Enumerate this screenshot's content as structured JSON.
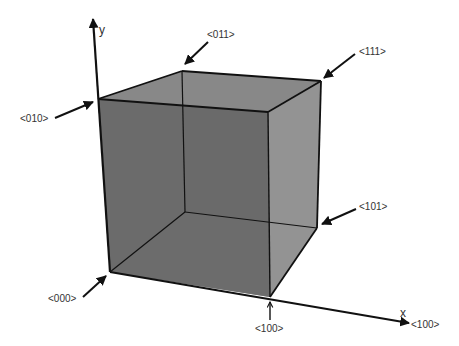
{
  "diagram": {
    "type": "unit-cube-vertex-labels",
    "axes": {
      "y": {
        "label": "y"
      },
      "x": {
        "label": "x"
      }
    },
    "vertices": [
      {
        "id": "000",
        "label": "<000>"
      },
      {
        "id": "010",
        "label": "<010>"
      },
      {
        "id": "011",
        "label": "<011>"
      },
      {
        "id": "111",
        "label": "<111>"
      },
      {
        "id": "101",
        "label": "<101>"
      },
      {
        "id": "100",
        "label": "<100>"
      },
      {
        "id": "x-axis-end",
        "label": "<100>"
      }
    ],
    "colors": {
      "front_face": "#6b6b6b",
      "back_face": "#5e5e5e",
      "top_face": "#8a8a8a",
      "right_face": "#939393",
      "bottom_face": "#6e6e6e",
      "edges": "#111111",
      "labels": "#333333"
    }
  }
}
